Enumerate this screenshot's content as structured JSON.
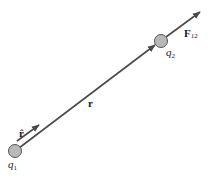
{
  "diagram": {
    "colors": {
      "background": "#ffffff",
      "arrow": "#4a4a4a",
      "charge_fill": "#b8b8b8",
      "charge_stroke": "#555555",
      "text": "#222222"
    },
    "charges": [
      {
        "id": "q1",
        "label_base": "q",
        "label_sub": "1",
        "cx": 15,
        "cy": 151,
        "r": 6
      },
      {
        "id": "q2",
        "label_base": "q",
        "label_sub": "2",
        "cx": 161,
        "cy": 41,
        "r": 6
      }
    ],
    "vectors": [
      {
        "id": "r",
        "label": "r",
        "from": [
          19,
          148
        ],
        "to": [
          155,
          45
        ]
      },
      {
        "id": "r_hat",
        "label": "r̂",
        "from": [
          17,
          141
        ],
        "to": [
          39,
          125
        ]
      },
      {
        "id": "F12",
        "label_base": "F",
        "label_sub": "12",
        "from": [
          166,
          37
        ],
        "to": [
          200,
          12
        ]
      }
    ],
    "labels": {
      "r_hat": "r̂",
      "r": "r",
      "q1_base": "q",
      "q1_sub": "1",
      "q2_base": "q",
      "q2_sub": "2",
      "F12_base": "F",
      "F12_sub": "12"
    }
  }
}
